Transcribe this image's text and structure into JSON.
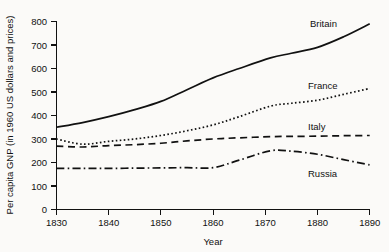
{
  "chart_data": {
    "type": "line",
    "title": "",
    "xlabel": "Year",
    "ylabel": "Per capita GNP (in 1960 US dollars and prices)",
    "xlim": [
      1830,
      1890
    ],
    "ylim": [
      0,
      800
    ],
    "grid": false,
    "legend_position": "inline-right-of-series",
    "xticks": [
      "1830",
      "1840",
      "1850",
      "1860",
      "1870",
      "1880",
      "1890"
    ],
    "yticks": [
      "0",
      "100",
      "200",
      "300",
      "400",
      "500",
      "600",
      "700",
      "800"
    ],
    "x": [
      1830,
      1835,
      1840,
      1845,
      1850,
      1855,
      1860,
      1865,
      1871,
      1875,
      1880,
      1885,
      1890
    ],
    "series": [
      {
        "name": "Britain",
        "style": "solid",
        "label": "Britain",
        "values": [
          350,
          370,
          395,
          425,
          460,
          510,
          560,
          600,
          645,
          665,
          690,
          735,
          790
        ]
      },
      {
        "name": "France",
        "style": "dotted",
        "label": "France",
        "values": [
          300,
          278,
          290,
          300,
          315,
          335,
          360,
          395,
          440,
          452,
          465,
          490,
          515
        ]
      },
      {
        "name": "Italy",
        "style": "dashed",
        "label": "Italy",
        "values": [
          270,
          266,
          272,
          276,
          282,
          292,
          300,
          305,
          310,
          311,
          312,
          314,
          315
        ]
      },
      {
        "name": "Russia",
        "style": "dashdot",
        "label": "Russia",
        "values": [
          175,
          175,
          175,
          176,
          177,
          178,
          178,
          210,
          250,
          248,
          235,
          212,
          190
        ]
      }
    ]
  },
  "labels": {
    "britain": "Britain",
    "france": "France",
    "italy": "Italy",
    "russia": "Russia",
    "xlabel": "Year",
    "ylabel": "Per capita GNP (in 1960 US dollars and prices)",
    "x0": "1830",
    "x1": "1840",
    "x2": "1850",
    "x3": "1860",
    "x4": "1870",
    "x5": "1880",
    "x6": "1890",
    "y0": "0",
    "y1": "100",
    "y2": "200",
    "y3": "300",
    "y4": "400",
    "y5": "500",
    "y6": "600",
    "y7": "700",
    "y8": "800"
  }
}
